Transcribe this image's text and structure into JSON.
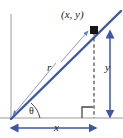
{
  "figure": {
    "name": "right-triangle-trigonometry-diagram",
    "labels": {
      "point": "(x, y)",
      "hypotenuse": "r",
      "vertical_leg": "y",
      "horizontal_leg": "x",
      "angle": "θ"
    },
    "colors": {
      "ray": "#3b57a6",
      "dimension_arrow": "#3b57a6",
      "axis": "#9a9a96",
      "dashed_drop_line": "#4a4641",
      "point_dot": "#161616",
      "right_angle_mark": "#4a4641",
      "leader_line": "#6b7fc0",
      "background": "#ffffff"
    },
    "geometry": {
      "origin": [
        12,
        118
      ],
      "point": [
        94,
        30
      ],
      "ray_end": [
        120,
        12
      ],
      "baseline_y": 118,
      "vertical_axis_x": 11,
      "x_dimension": {
        "from": 11,
        "to": 96,
        "y": 128
      },
      "y_dimension": {
        "x": 110,
        "from": 30,
        "to": 117
      }
    }
  }
}
